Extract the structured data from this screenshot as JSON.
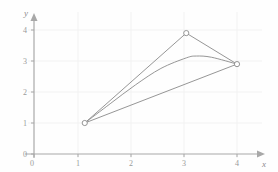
{
  "chart_data": {
    "type": "line",
    "title": "",
    "subtitle": "",
    "xlabel": "x",
    "ylabel": "y",
    "xlim": [
      0,
      4.45
    ],
    "ylim": [
      0,
      4.3
    ],
    "xticks": [
      "0",
      "1",
      "2",
      "3",
      "4"
    ],
    "xtick_values": [
      0,
      1,
      2,
      3,
      4
    ],
    "yticks": [
      "0",
      "1",
      "2",
      "3",
      "4"
    ],
    "ytick_values": [
      0,
      1,
      2,
      3,
      4
    ],
    "grid": true,
    "grid_color": "#f0f0f0",
    "legend": "none",
    "axis_color": "#a8a8a8",
    "curve_color": "#8a8a8a",
    "marker_style": "open-circle",
    "marker_color": "#8a8a8a",
    "points": [
      {
        "x": 1,
        "y": 1
      },
      {
        "x": 3,
        "y": 3.9
      },
      {
        "x": 4,
        "y": 2.9
      }
    ],
    "series": [
      {
        "name": "polyline-through-points",
        "style": "straight-segments",
        "x": [
          1,
          3,
          4
        ],
        "values": [
          1,
          3.9,
          2.9
        ]
      },
      {
        "name": "smooth-curve",
        "style": "spline",
        "x": [
          1,
          1.5,
          2,
          2.5,
          3,
          3.2,
          3.5,
          4
        ],
        "values": [
          1,
          1.62,
          2.23,
          2.76,
          3.1,
          3.16,
          3.12,
          2.9
        ]
      },
      {
        "name": "chord-line",
        "style": "straight",
        "x": [
          1,
          4
        ],
        "values": [
          1,
          2.9
        ]
      }
    ]
  },
  "axes": {
    "x_arrow": "arrow-right",
    "y_arrow": "arrow-up"
  }
}
